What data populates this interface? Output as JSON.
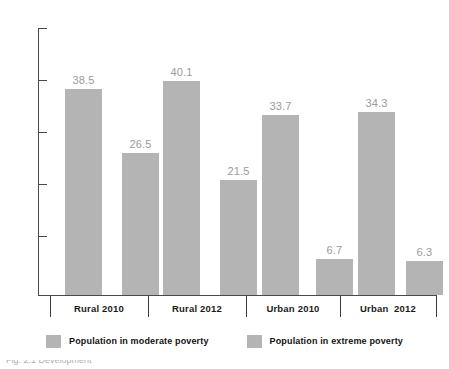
{
  "chart_data": {
    "type": "bar",
    "title": "",
    "xlabel": "",
    "ylabel": "",
    "ylim": [
      0,
      50
    ],
    "grid": false,
    "legend_position": "bottom",
    "categories": [
      "Rural 2010",
      "Rural 2012",
      "Urban 2010",
      "Urban  2012"
    ],
    "y_ticks": [
      10,
      20,
      30,
      40,
      50
    ],
    "y_tick_labels": [
      "10",
      "20",
      "30",
      "40",
      "50"
    ],
    "series": [
      {
        "name": "Population in moderate poverty",
        "color": "#b4b4b4",
        "values": [
          38.5,
          40.1,
          33.7,
          34.3
        ]
      },
      {
        "name": "Population in extreme poverty",
        "color": "#b4b4b4",
        "values": [
          26.5,
          21.5,
          6.7,
          6.3
        ]
      }
    ],
    "bars": [
      {
        "label": "38.5",
        "value": 38.5,
        "group": "Rural 2010",
        "series": "Population in moderate poverty"
      },
      {
        "label": "26.5",
        "value": 26.5,
        "group": "Rural 2010",
        "series": "Population in extreme poverty"
      },
      {
        "label": "40.1",
        "value": 40.1,
        "group": "Rural 2012",
        "series": "Population in moderate poverty"
      },
      {
        "label": "21.5",
        "value": 21.5,
        "group": "Rural 2012",
        "series": "Population in extreme poverty"
      },
      {
        "label": "33.7",
        "value": 33.7,
        "group": "Urban 2010",
        "series": "Population in moderate poverty"
      },
      {
        "label": "6.7",
        "value": 6.7,
        "group": "Urban 2010",
        "series": "Population in extreme poverty"
      },
      {
        "label": "34.3",
        "value": 34.3,
        "group": "Urban  2012",
        "series": "Population in moderate poverty"
      },
      {
        "label": "6.3",
        "value": 6.3,
        "group": "Urban  2012",
        "series": "Population in extreme poverty"
      }
    ]
  },
  "legend": {
    "items": [
      {
        "label": "Population in moderate poverty",
        "color": "#b4b4b4"
      },
      {
        "label": "Population in extreme poverty",
        "color": "#b4b4b4"
      }
    ]
  },
  "caption": {
    "text": "Fig. 2.1  Development"
  },
  "colors": {
    "bar": "#b4b4b4",
    "axis": "#4a4a4a",
    "value_label": "#9b9b9b",
    "category_label": "#1b1b1b",
    "background": "#ffffff"
  }
}
